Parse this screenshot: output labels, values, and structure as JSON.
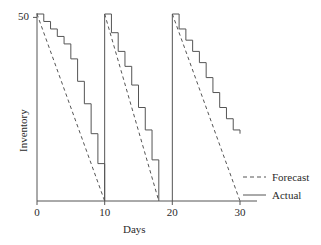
{
  "chart_data": {
    "type": "line",
    "title": "",
    "subtitle": "",
    "xlabel": "Days",
    "ylabel": "Inventory",
    "xlim": [
      0,
      31
    ],
    "ylim": [
      0,
      52
    ],
    "grid": false,
    "xticks": [
      0,
      10,
      20,
      30
    ],
    "xtick_labels": [
      "0",
      "10",
      "20",
      "30"
    ],
    "yticks": [
      50
    ],
    "ytick_labels": [
      "50"
    ],
    "legend": {
      "position": "right",
      "entries": [
        {
          "name": "Forecast",
          "style": "dashed",
          "color": "#555555"
        },
        {
          "name": "Actual",
          "style": "solid",
          "color": "#555555"
        }
      ]
    },
    "series": [
      {
        "name": "Forecast",
        "style": "dashed",
        "color": "#555555",
        "points": [
          [
            0,
            50
          ],
          [
            10,
            0
          ],
          [
            10,
            50
          ],
          [
            18,
            0
          ],
          [
            20,
            50
          ],
          [
            30,
            0
          ]
        ]
      },
      {
        "name": "Actual",
        "style": "solid-step",
        "color": "#555555",
        "cycles": [
          {
            "start_day": 0,
            "end_day": 10,
            "steps": [
              [
                0,
                50
              ],
              [
                1,
                48
              ],
              [
                2,
                46
              ],
              [
                3,
                44
              ],
              [
                4,
                42
              ],
              [
                5,
                38
              ],
              [
                6,
                32
              ],
              [
                7,
                26
              ],
              [
                8,
                18
              ],
              [
                9,
                10
              ],
              [
                10,
                0
              ]
            ]
          },
          {
            "start_day": 10,
            "end_day": 18,
            "steps": [
              [
                10,
                50
              ],
              [
                11,
                45
              ],
              [
                12,
                40
              ],
              [
                13,
                36
              ],
              [
                14,
                31
              ],
              [
                15,
                25
              ],
              [
                16,
                19
              ],
              [
                17,
                11
              ],
              [
                18,
                0
              ]
            ]
          },
          {
            "start_day": 20,
            "end_day": 30,
            "steps": [
              [
                20,
                50
              ],
              [
                21,
                46
              ],
              [
                22,
                43
              ],
              [
                23,
                40
              ],
              [
                24,
                37
              ],
              [
                25,
                33
              ],
              [
                26,
                29
              ],
              [
                27,
                25
              ],
              [
                28,
                22
              ],
              [
                29,
                19
              ],
              [
                30,
                18
              ]
            ]
          }
        ]
      }
    ],
    "annotations": []
  },
  "axes": {
    "ylabel": "Inventory",
    "xlabel": "Days",
    "ytick_50": "50",
    "xtick_0": "0",
    "xtick_10": "10",
    "xtick_20": "20",
    "xtick_30": "30"
  },
  "legend": {
    "forecast_label": "Forecast",
    "actual_label": "Actual"
  },
  "colors": {
    "line": "#555555",
    "axis": "#555555",
    "text": "#2b2b2b",
    "background": "#ffffff"
  }
}
